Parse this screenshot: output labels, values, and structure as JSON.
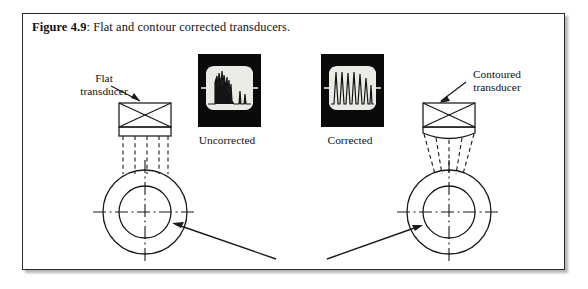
{
  "figure": {
    "caption_number": "Figure 4.9",
    "caption_separator": ": ",
    "caption_text": "Flat and contour corrected transducers.",
    "border_color": "#2b2b2b",
    "background_color": "#ffffff",
    "ink_color": "#111111"
  },
  "labels": {
    "flat_transducer_line1": "Flat",
    "flat_transducer_line2": "transducer",
    "contoured_transducer_line1": "Contoured",
    "contoured_transducer_line2": "transducer",
    "uncorrected_panel": "Uncorrected",
    "corrected_panel": "Corrected"
  },
  "panels": {
    "uncorrected": {
      "label": "Uncorrected",
      "background_color": "#0a0a0a",
      "trace_color": "#e8e8e4",
      "description": "Oscilloscope capture showing an irregular ultrasonic signal envelope with uneven amplitude spikes"
    },
    "corrected": {
      "label": "Corrected",
      "background_color": "#0a0a0a",
      "trace_color": "#e8e8e4",
      "description": "Oscilloscope capture showing a regular train of evenly spaced uniform amplitude spikes"
    }
  },
  "diagram": {
    "left_assembly": {
      "transducer_type": "flat",
      "beam_style": "parallel dashed rays",
      "target": "concentric pipe cross-section with centerlines"
    },
    "right_assembly": {
      "transducer_type": "contoured",
      "beam_style": "converging dashed rays",
      "target": "concentric pipe cross-section with centerlines"
    }
  }
}
